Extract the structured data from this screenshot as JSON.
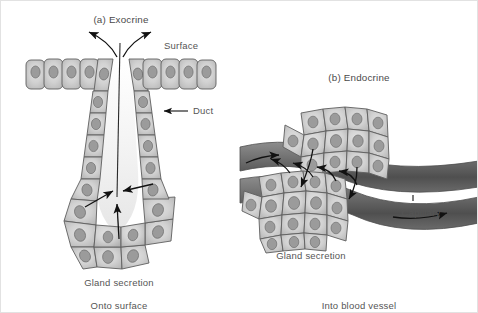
{
  "figure": {
    "title_a": "(a) Exocrine",
    "title_b": "(b) Endocrine",
    "labels": {
      "surface": "Surface",
      "duct": "Duct",
      "capillary": "Capillary",
      "gland_secretion_left": "Gland secretion",
      "gland_secretion_right": "Gland secretion",
      "onto_surface": "Onto surface",
      "into_blood_vessel": "Into blood vessel"
    },
    "colors": {
      "background": "#ffffff",
      "cell_fill": "#c8c8c8",
      "cell_fill_light": "#dcdcdc",
      "cell_outline": "#5f5f5f",
      "nucleus": "#9b9b9b",
      "nucleus_outline": "#6f6f6f",
      "lumen": "#f4f4f4",
      "vessel_dark": "#5a5a5a",
      "vessel_mid": "#7d7d7d",
      "arrow": "#111111",
      "text": "#555555"
    }
  }
}
